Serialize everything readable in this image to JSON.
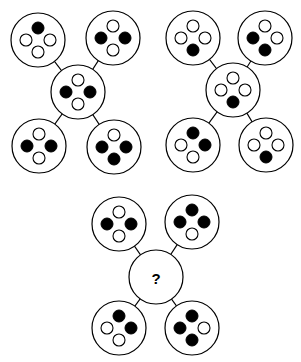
{
  "figure": {
    "background_color": "#ffffff",
    "stroke_color": "#000000",
    "filled_dot_color": "#000000",
    "empty_dot_color": "#ffffff",
    "node_radius": 27,
    "dot_radius": 6,
    "dot_offset": 12,
    "unknown_marker": "?"
  },
  "dot_positions": [
    "top",
    "left",
    "right",
    "bottom"
  ],
  "groups": [
    {
      "id": "group-1",
      "name": "top-left-group",
      "center": {
        "x": 78,
        "y": 92
      },
      "center_node": {
        "name": "center-node",
        "dots": {
          "top": "empty",
          "left": "filled",
          "right": "filled",
          "bottom": "empty"
        },
        "filled_count": 2
      },
      "satellites": [
        {
          "name": "top-left-node",
          "position": "top-left",
          "center": {
            "x": 38,
            "y": 40
          },
          "dots": {
            "top": "filled",
            "left": "empty",
            "right": "empty",
            "bottom": "empty"
          },
          "filled_count": 1
        },
        {
          "name": "top-right-node",
          "position": "top-right",
          "center": {
            "x": 113,
            "y": 38
          },
          "dots": {
            "top": "empty",
            "left": "filled",
            "right": "filled",
            "bottom": "empty"
          },
          "filled_count": 2
        },
        {
          "name": "bottom-left-node",
          "position": "bottom-left",
          "center": {
            "x": 39,
            "y": 146
          },
          "dots": {
            "top": "empty",
            "left": "filled",
            "right": "filled",
            "bottom": "empty"
          },
          "filled_count": 2
        },
        {
          "name": "bottom-right-node",
          "position": "bottom-right",
          "center": {
            "x": 114,
            "y": 147
          },
          "dots": {
            "top": "empty",
            "left": "filled",
            "right": "filled",
            "bottom": "filled"
          },
          "filled_count": 3
        }
      ]
    },
    {
      "id": "group-2",
      "name": "top-right-group",
      "center": {
        "x": 233,
        "y": 90
      },
      "center_node": {
        "name": "center-node",
        "dots": {
          "top": "empty",
          "left": "empty",
          "right": "empty",
          "bottom": "filled"
        },
        "filled_count": 1
      },
      "satellites": [
        {
          "name": "top-left-node",
          "position": "top-left",
          "center": {
            "x": 193,
            "y": 38
          },
          "dots": {
            "top": "empty",
            "left": "empty",
            "right": "empty",
            "bottom": "filled"
          },
          "filled_count": 1
        },
        {
          "name": "top-right-node",
          "position": "top-right",
          "center": {
            "x": 265,
            "y": 38
          },
          "dots": {
            "top": "empty",
            "left": "filled",
            "right": "empty",
            "bottom": "filled"
          },
          "filled_count": 2
        },
        {
          "name": "bottom-left-node",
          "position": "bottom-left",
          "center": {
            "x": 193,
            "y": 145
          },
          "dots": {
            "top": "filled",
            "left": "empty",
            "right": "filled",
            "bottom": "empty"
          },
          "filled_count": 2
        },
        {
          "name": "bottom-right-node",
          "position": "bottom-right",
          "center": {
            "x": 266,
            "y": 145
          },
          "dots": {
            "top": "empty",
            "left": "empty",
            "right": "empty",
            "bottom": "filled"
          },
          "filled_count": 1
        }
      ]
    },
    {
      "id": "group-3",
      "name": "bottom-answer-group",
      "center": {
        "x": 156,
        "y": 277
      },
      "center_node": {
        "name": "center-node-unknown",
        "unknown": true,
        "label": "?",
        "dots": null,
        "filled_count": null
      },
      "satellites": [
        {
          "name": "top-left-node",
          "position": "top-left",
          "center": {
            "x": 119,
            "y": 224
          },
          "dots": {
            "top": "empty",
            "left": "filled",
            "right": "filled",
            "bottom": "empty"
          },
          "filled_count": 2
        },
        {
          "name": "top-right-node",
          "position": "top-right",
          "center": {
            "x": 192,
            "y": 222
          },
          "dots": {
            "top": "filled",
            "left": "filled",
            "right": "filled",
            "bottom": "empty"
          },
          "filled_count": 3
        },
        {
          "name": "bottom-left-node",
          "position": "bottom-left",
          "center": {
            "x": 119,
            "y": 328
          },
          "dots": {
            "top": "filled",
            "left": "empty",
            "right": "filled",
            "bottom": "empty"
          },
          "filled_count": 2
        },
        {
          "name": "bottom-right-node",
          "position": "bottom-right",
          "center": {
            "x": 192,
            "y": 328
          },
          "dots": {
            "top": "filled",
            "left": "filled",
            "right": "empty",
            "bottom": "filled"
          },
          "filled_count": 3
        }
      ]
    }
  ]
}
